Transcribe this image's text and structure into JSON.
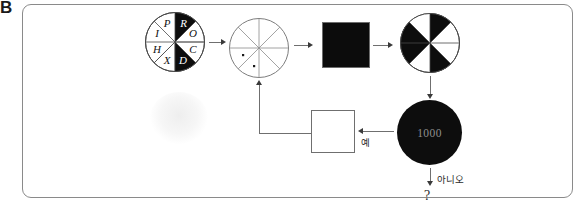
{
  "panel": {
    "label": "B"
  },
  "figure": {
    "type": "flowchart-diagram",
    "nodes": [
      {
        "id": "lettered-wheel",
        "kind": "pie-wheel",
        "sectors": 8,
        "letters": [
          "P",
          "R",
          "O",
          "C",
          "D",
          "X",
          "H",
          "I"
        ],
        "filled_letters": [
          "R",
          "D"
        ]
      },
      {
        "id": "empty-wheel",
        "kind": "pie-wheel",
        "sectors": 8,
        "letters": [],
        "dots": 2
      },
      {
        "id": "black-square",
        "kind": "square",
        "fill": "#0c0c0c"
      },
      {
        "id": "pinwheel",
        "kind": "pie-wheel",
        "sectors": 8,
        "pattern": "alternating"
      },
      {
        "id": "counter-disc",
        "kind": "disc",
        "value": "1000"
      },
      {
        "id": "empty-square",
        "kind": "square",
        "fill": "#ffffff"
      }
    ],
    "edges": [
      {
        "id": "e1",
        "label": ""
      },
      {
        "id": "e2",
        "label": ""
      },
      {
        "id": "e3",
        "label": ""
      },
      {
        "id": "e4",
        "label": ""
      },
      {
        "id": "e5",
        "label": "예"
      },
      {
        "id": "e6",
        "label": "아니오"
      },
      {
        "id": "e7",
        "label": ""
      }
    ],
    "terminal": "?"
  },
  "colors": {
    "border": "#8a8a8a",
    "ink": "#0c0c0c",
    "line": "#6f6f6f",
    "disc_text": "#8f8f8f"
  }
}
